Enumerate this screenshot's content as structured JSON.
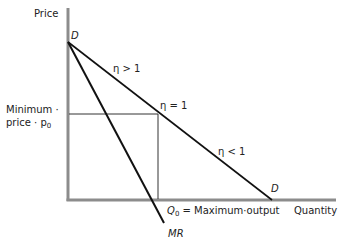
{
  "diagram": {
    "axes": {
      "y_label": "Price",
      "x_label": "Quantity"
    },
    "curves": {
      "demand_top_label": "D",
      "demand_bottom_label": "D",
      "marginal_revenue_label": "MR"
    },
    "elasticity": {
      "elastic": "η > 1",
      "unit": "η = 1",
      "inelastic": "η < 1"
    },
    "minimum_price": {
      "line1": "Minimum ·",
      "line2_prefix": "price · ",
      "symbol": "p",
      "subscript": "0"
    },
    "max_output": {
      "symbol": "Q",
      "subscript": "0",
      "text": " = Maximum·output"
    },
    "colors": {
      "axis": "#8c8c8c",
      "curve": "#111111",
      "guide": "#333333"
    }
  }
}
